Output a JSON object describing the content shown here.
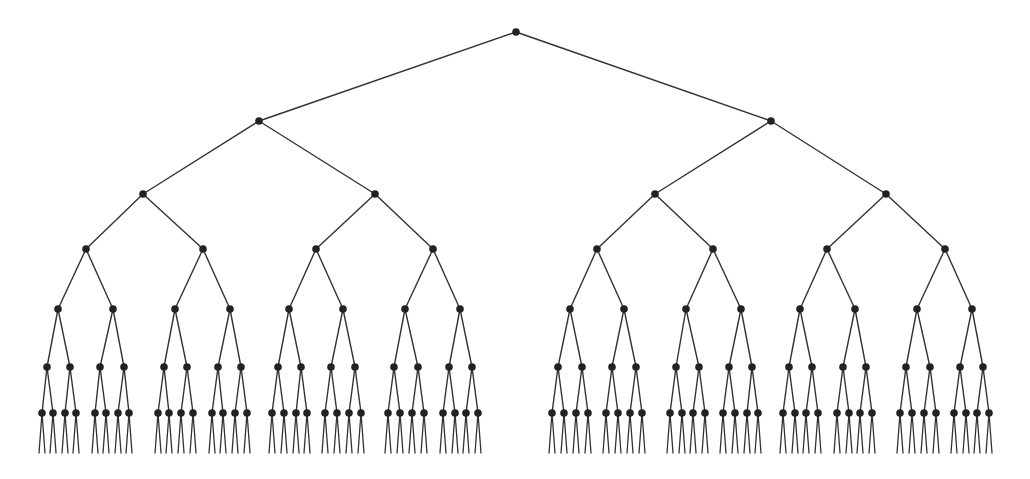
{
  "diagram": {
    "type": "binary-tree",
    "depth_levels": 7,
    "colors": {
      "background": "#ffffff",
      "edge": "#333333",
      "node": "#222222"
    },
    "node_radius": 3.8,
    "stub": {
      "dx": 3,
      "end_y": 453
    },
    "levels": [
      {
        "y": 32,
        "x": [
          516
        ]
      },
      {
        "y": 121,
        "x": [
          259,
          771
        ]
      },
      {
        "y": 194,
        "x": [
          143,
          375,
          655,
          886
        ]
      },
      {
        "y": 249,
        "x": [
          86,
          203,
          316,
          433,
          597,
          713,
          827,
          945
        ]
      },
      {
        "y": 309,
        "x": [
          58,
          113,
          175,
          230,
          289,
          343,
          405,
          460,
          570,
          624,
          686,
          741,
          800,
          855,
          917,
          972
        ]
      },
      {
        "y": 367,
        "x": [
          47,
          70,
          100,
          124,
          164,
          187,
          218,
          241,
          278,
          301,
          331,
          355,
          394,
          418,
          449,
          472,
          558,
          582,
          612,
          636,
          676,
          699,
          729,
          752,
          789,
          812,
          843,
          866,
          906,
          930,
          960,
          983
        ]
      },
      {
        "y": 413,
        "x": [
          42,
          53,
          65,
          76,
          95,
          106,
          118,
          129,
          158,
          169,
          181,
          193,
          212,
          223,
          235,
          247,
          272,
          284,
          296,
          307,
          325,
          337,
          349,
          361,
          388,
          400,
          412,
          424,
          443,
          455,
          466,
          478,
          552,
          564,
          576,
          588,
          606,
          618,
          630,
          642,
          670,
          682,
          693,
          705,
          723,
          735,
          747,
          758,
          783,
          795,
          806,
          818,
          837,
          849,
          860,
          872,
          900,
          912,
          924,
          936,
          954,
          966,
          977,
          989
        ]
      }
    ]
  }
}
